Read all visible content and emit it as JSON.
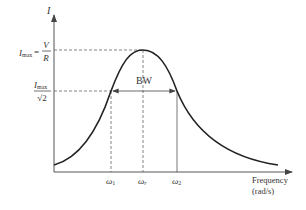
{
  "diagram": {
    "y_axis": {
      "label": "I"
    },
    "x_axis": {
      "label_line1": "Frequency",
      "label_line2": "(rad/s)"
    },
    "levels": {
      "imax_lhs": "I",
      "imax_sub": "max",
      "imax_eq": "=",
      "imax_num": "V",
      "imax_den": "R",
      "half_num": "I",
      "half_num_sub": "max",
      "half_den": "√2"
    },
    "bandwidth_label": "BW",
    "frequencies": [
      {
        "symbol": "ω",
        "sub": "1"
      },
      {
        "symbol": "ω",
        "sub": "r"
      },
      {
        "symbol": "ω",
        "sub": "2"
      }
    ],
    "colors": {
      "curve": "#222222",
      "axis": "#555555",
      "dashed": "#666666"
    }
  }
}
